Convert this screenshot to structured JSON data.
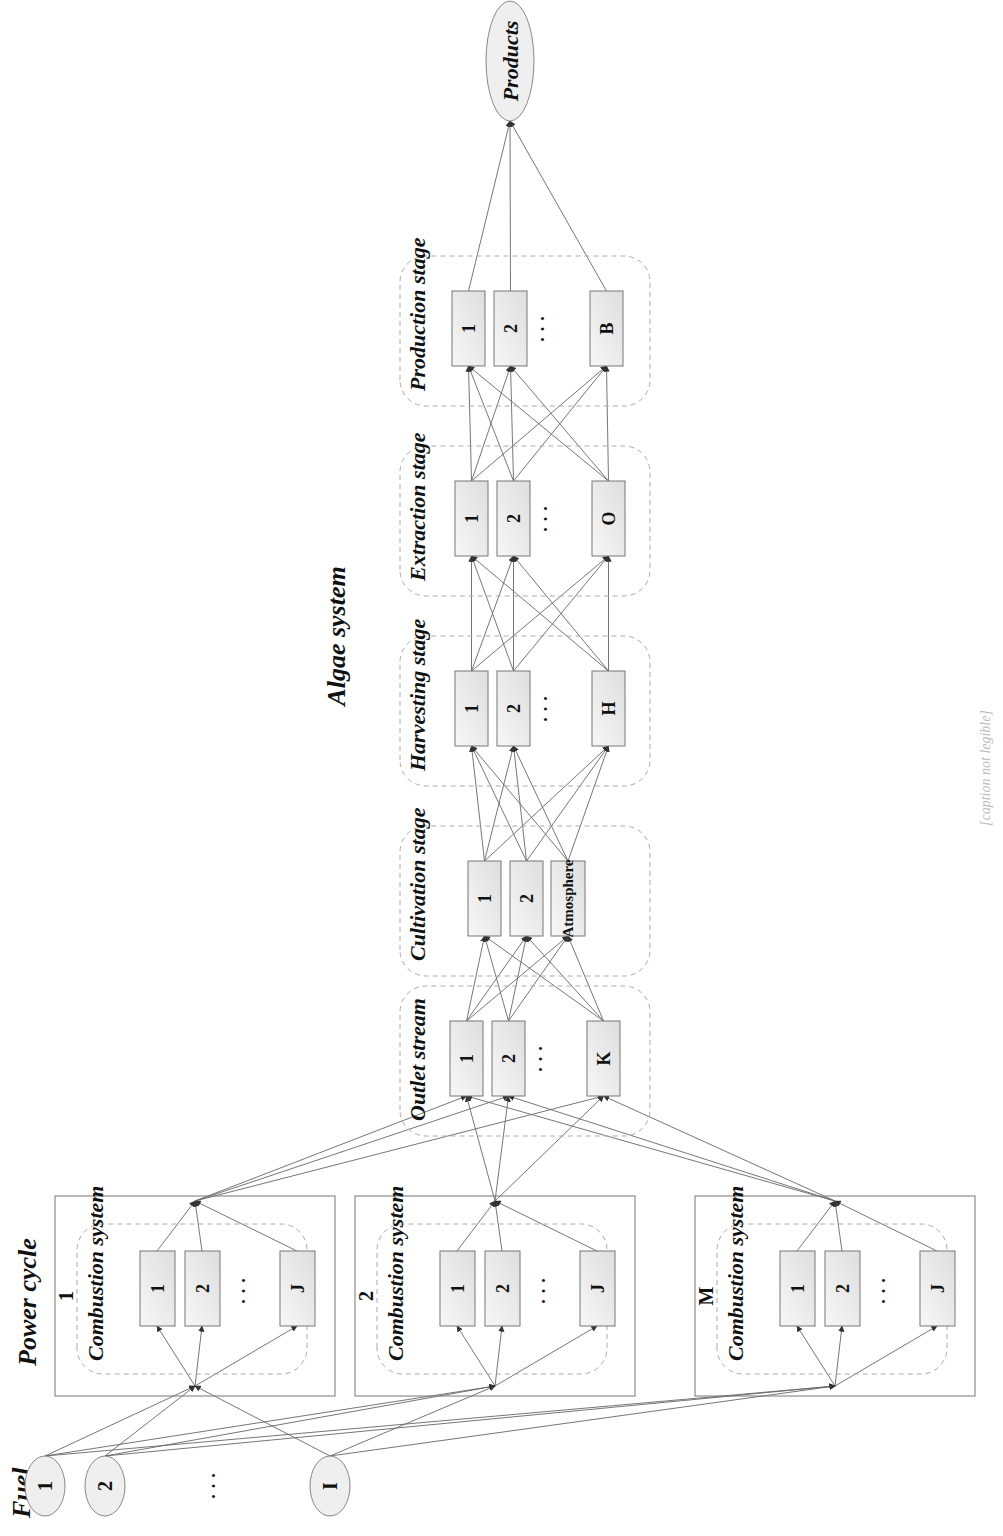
{
  "caption": {
    "status": "unread",
    "note": "Caption text along the right edge was not legible in any zoom; exact wording unknown.",
    "placeholder": "[caption not legible]"
  },
  "power_cycle": {
    "title": "Power cycle",
    "units": [
      {
        "index": "1",
        "label": "Combustion system",
        "systems": [
          "1",
          "2",
          "J"
        ]
      },
      {
        "index": "2",
        "label": "Combustion system",
        "systems": [
          "1",
          "2",
          "J"
        ]
      },
      {
        "index": "M",
        "label": "Combustion system",
        "systems": [
          "1",
          "2",
          "J"
        ]
      }
    ]
  },
  "fuel": {
    "label": "Fuel",
    "items": [
      "1",
      "2",
      "I"
    ]
  },
  "algae_system": {
    "title": "Algae system",
    "stages": [
      {
        "label": "Outlet stream",
        "nodes": [
          "1",
          "2",
          "K"
        ]
      },
      {
        "label": "Cultivation stage",
        "nodes": [
          "1",
          "2",
          "Atmosphere"
        ]
      },
      {
        "label": "Harvesting stage",
        "nodes": [
          "1",
          "2",
          "H"
        ]
      },
      {
        "label": "Extraction stage",
        "nodes": [
          "1",
          "2",
          "O"
        ]
      },
      {
        "label": "Production stage",
        "nodes": [
          "1",
          "2",
          "B"
        ]
      }
    ]
  },
  "products": {
    "label": "Products"
  },
  "ellipsis": "· · ·",
  "colors": {
    "box_fill": "#ececec",
    "line": "#555555",
    "dashed": "#aaaaaa",
    "arrow": "#333333"
  }
}
